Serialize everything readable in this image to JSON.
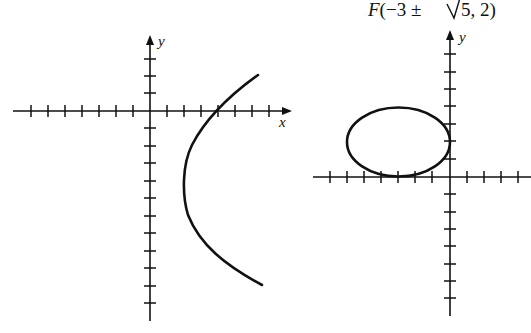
{
  "figure": {
    "caption_text": "F(−3 ± √5, 2)",
    "caption_parts": {
      "F": "F",
      "open": "(−3 ± ",
      "root": "5",
      "close": ", 2)"
    },
    "colors": {
      "ink": "#111111",
      "background": "#ffffff"
    }
  },
  "left_graph": {
    "x_label": "x",
    "y_label": "y",
    "curve": "hyperbola branch (right)",
    "x_ticks": [
      -8,
      -7,
      -6,
      -5,
      -4,
      -3,
      -2,
      -1,
      1,
      2,
      3,
      4,
      5,
      6,
      7,
      8
    ],
    "y_ticks": [
      3,
      2,
      1,
      -1,
      -2,
      -3,
      -4,
      -5,
      -6,
      -7,
      -8,
      -9,
      -10,
      -11
    ]
  },
  "right_graph": {
    "y_label": "y",
    "curve": "ellipse",
    "ellipse": {
      "center": [
        -3,
        2
      ],
      "a": 3,
      "b": 2
    },
    "x_ticks": [
      -8,
      -7,
      -6,
      -5,
      -4,
      -3,
      -2,
      -1,
      1,
      2,
      3,
      4
    ],
    "y_ticks": [
      7,
      6,
      5,
      4,
      3,
      2,
      1,
      -1,
      -2,
      -3,
      -4,
      -5,
      -6,
      -7,
      -8
    ]
  }
}
